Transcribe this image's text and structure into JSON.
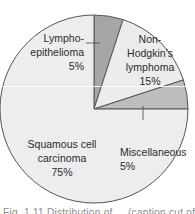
{
  "chart_data": {
    "type": "pie",
    "title": "",
    "start": "12 o'clock, clockwise",
    "slices": [
      {
        "label_lines": [
          "Lympho-",
          "epithelioma",
          "5%"
        ],
        "label": "Lympho-epithelioma",
        "value": 5,
        "color": "#a6a6a6"
      },
      {
        "label_lines": [
          "Non-",
          "Hodgkin's",
          "lymphoma",
          "15%"
        ],
        "label": "Non-Hodgkin's lymphoma",
        "value": 15,
        "color": "#ececec"
      },
      {
        "label_lines": [
          "Miscellaneous",
          "5%"
        ],
        "label": "Miscellaneous",
        "value": 5,
        "color": "#bdbdbd"
      },
      {
        "label_lines": [
          "Squamous cell",
          "carcinoma",
          "75%"
        ],
        "label": "Squamous cell carcinoma",
        "value": 75,
        "color": "#ededed"
      }
    ],
    "outline_color": "#555555"
  },
  "caption": "Fig. 1.11 Distribution of ... (caption cut off)"
}
